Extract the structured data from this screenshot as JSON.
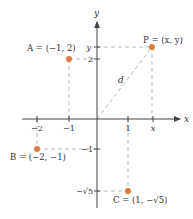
{
  "figure": {
    "axes": {
      "x_label": "x",
      "y_label": "y",
      "x_ticks": [
        {
          "value": -2,
          "label": "−2",
          "px": 37
        },
        {
          "value": -1,
          "label": "−1",
          "px": 69
        },
        {
          "value": 1,
          "label": "1",
          "px": 128
        },
        {
          "value": "x",
          "label": "x",
          "px": 153
        }
      ],
      "y_ticks": [
        {
          "value": "y",
          "label": "y",
          "py": 47
        },
        {
          "value": 2,
          "label": "2",
          "py": 59
        },
        {
          "value": -1,
          "label": "−1",
          "py": 149
        },
        {
          "value": "-sqrt5",
          "label": "−√5",
          "py": 191
        }
      ]
    },
    "points": [
      {
        "name": "A",
        "label": "A = (−1, 2)",
        "coords": [
          -1,
          2
        ]
      },
      {
        "name": "P",
        "label": "P = (x, y)",
        "coords": [
          "x",
          "y"
        ]
      },
      {
        "name": "B",
        "label": "B = (−2, −1)",
        "coords": [
          -2,
          -1
        ]
      },
      {
        "name": "C",
        "label": "C = (1, −√5)",
        "coords": [
          1,
          "−√5"
        ]
      }
    ],
    "distance_label": "d",
    "colors": {
      "point": "#e07a3a",
      "dashed": "#a9bdb4",
      "axis": "#444444",
      "text": "#333333"
    }
  }
}
